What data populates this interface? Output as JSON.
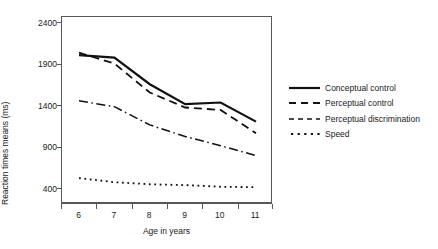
{
  "chart_data": {
    "type": "line",
    "title": "",
    "xlabel": "Age in years",
    "ylabel": "Reaction times means (ms)",
    "x": [
      6,
      7,
      8,
      9,
      10,
      11
    ],
    "xtick_labels": [
      "6",
      "7",
      "8",
      "9",
      "10",
      "11"
    ],
    "ytick_labels": [
      "400",
      "900",
      "1400",
      "1900",
      "2400"
    ],
    "ytick_values": [
      400,
      900,
      1400,
      1900,
      2400
    ],
    "xlim": [
      5.5,
      11.5
    ],
    "ylim": [
      400,
      2400
    ],
    "grid": false,
    "legend_position": "right",
    "series": [
      {
        "name": "Conceptual control",
        "style": "solid",
        "color": "#111111",
        "width": 2.2,
        "values": [
          2000,
          1970,
          1650,
          1410,
          1430,
          1200
        ]
      },
      {
        "name": "Perceptual control",
        "style": "dashed",
        "color": "#111111",
        "width": 1.8,
        "values": [
          2030,
          1900,
          1550,
          1370,
          1340,
          1060
        ]
      },
      {
        "name": "Perceptual discrimination",
        "style": "dashdot",
        "color": "#111111",
        "width": 1.5,
        "values": [
          1450,
          1380,
          1160,
          1020,
          910,
          790
        ]
      },
      {
        "name": "Speed",
        "style": "dotted",
        "color": "#111111",
        "width": 1.8,
        "values": [
          520,
          470,
          445,
          435,
          415,
          410
        ]
      }
    ]
  },
  "legend": {
    "items": [
      {
        "label": "Conceptual control",
        "style": "solid"
      },
      {
        "label": "Perceptual control",
        "style": "dashed"
      },
      {
        "label": "Perceptual discrimination",
        "style": "dashdot"
      },
      {
        "label": "Speed",
        "style": "dotted"
      }
    ]
  },
  "axes": {
    "y_title": "Reaction times means (ms)",
    "x_title": "Age in years"
  }
}
